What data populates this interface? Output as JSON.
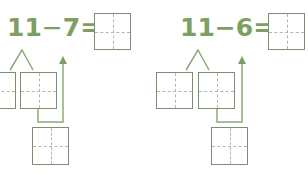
{
  "colors": {
    "text": "#7f9f62",
    "box_border": "#7a8f6e",
    "guide": "#b0b8a8",
    "line": "#8faa74"
  },
  "problems": [
    {
      "expression": "11−7=",
      "minuend": "11",
      "operator": "−",
      "subtrahend": "7",
      "equals": "=",
      "answer": ""
    },
    {
      "expression": "11−6=",
      "minuend": "11",
      "operator": "−",
      "subtrahend": "6",
      "equals": "=",
      "answer": ""
    }
  ]
}
